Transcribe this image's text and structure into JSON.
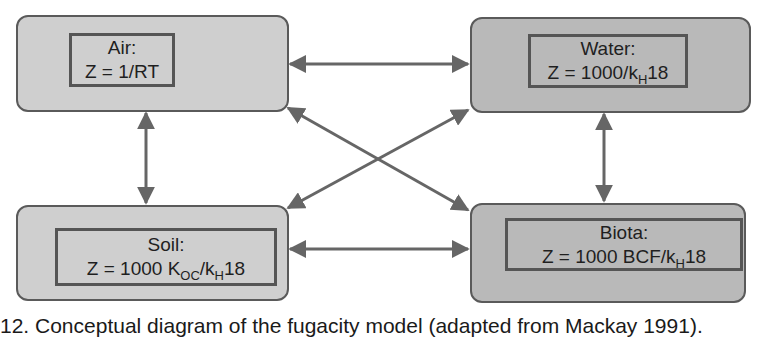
{
  "diagram": {
    "compartments": {
      "air": {
        "name": "Air:",
        "formula_prefix": "Z = 1/RT",
        "parts": []
      },
      "water": {
        "name": "Water:",
        "formula_a": "Z = 1000/k",
        "formula_sub": "H",
        "formula_b": "18"
      },
      "soil": {
        "name": "Soil:",
        "formula_a": "Z = 1000 K",
        "formula_sub1": "OC",
        "formula_mid": "/k",
        "formula_sub2": "H",
        "formula_b": "18"
      },
      "biota": {
        "name": "Biota:",
        "formula_a": "Z = 1000 BCF/k",
        "formula_sub": "H",
        "formula_b": "18"
      }
    },
    "connections": [
      {
        "from": "Air",
        "to": "Water",
        "type": "bidirectional"
      },
      {
        "from": "Air",
        "to": "Soil",
        "type": "bidirectional"
      },
      {
        "from": "Air",
        "to": "Biota",
        "type": "bidirectional"
      },
      {
        "from": "Water",
        "to": "Soil",
        "type": "bidirectional"
      },
      {
        "from": "Water",
        "to": "Biota",
        "type": "bidirectional"
      },
      {
        "from": "Soil",
        "to": "Biota",
        "type": "bidirectional"
      }
    ],
    "colors": {
      "box_fill_air": "#cfcfcf",
      "box_fill_water": "#b9b9b9",
      "box_fill_soil": "#cfcfcf",
      "box_fill_biota": "#b9b9b9",
      "border": "#5a5a5a",
      "arrow": "#666666"
    }
  },
  "caption": {
    "text": "12. Conceptual diagram of the fugacity model (adapted from Mackay 1991)."
  }
}
